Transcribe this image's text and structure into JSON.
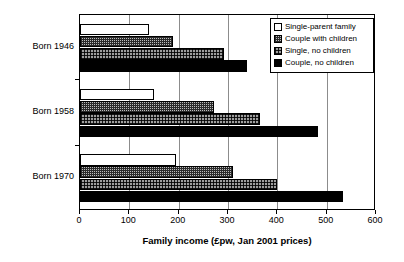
{
  "chart_data": {
    "type": "bar",
    "orientation": "horizontal",
    "title": "",
    "xlabel": "Family income (£pw, Jan 2001 prices)",
    "ylabel": "",
    "xlim": [
      0,
      600
    ],
    "xticks": [
      0,
      100,
      200,
      300,
      400,
      500,
      600
    ],
    "grid": true,
    "grid_axis": "x",
    "legend_position": "top-right",
    "categories": [
      "Born 1946",
      "Born 1958",
      "Born 1970"
    ],
    "series": [
      {
        "name": "Single-parent family",
        "color": "#ffffff",
        "pattern": "solid-white",
        "values": [
          139,
          149,
          195
        ]
      },
      {
        "name": "Couple with children",
        "color": "#bdbdbd",
        "pattern": "fine-grid",
        "values": [
          188,
          271,
          310
        ]
      },
      {
        "name": "Single, no children",
        "color": "#9e9e9e",
        "pattern": "checker",
        "values": [
          291,
          364,
          400
        ]
      },
      {
        "name": "Couple, no children",
        "color": "#000000",
        "pattern": "solid-black",
        "values": [
          338,
          482,
          534
        ]
      }
    ]
  },
  "axis": {
    "tick_labels": [
      "0",
      "100",
      "200",
      "300",
      "400",
      "500",
      "600"
    ],
    "title": "Family income (£pw, Jan 2001 prices)"
  },
  "legend": {
    "items": [
      {
        "label": "Single-parent family"
      },
      {
        "label": "Couple with children"
      },
      {
        "label": "Single, no children"
      },
      {
        "label": "Couple, no children"
      }
    ]
  }
}
